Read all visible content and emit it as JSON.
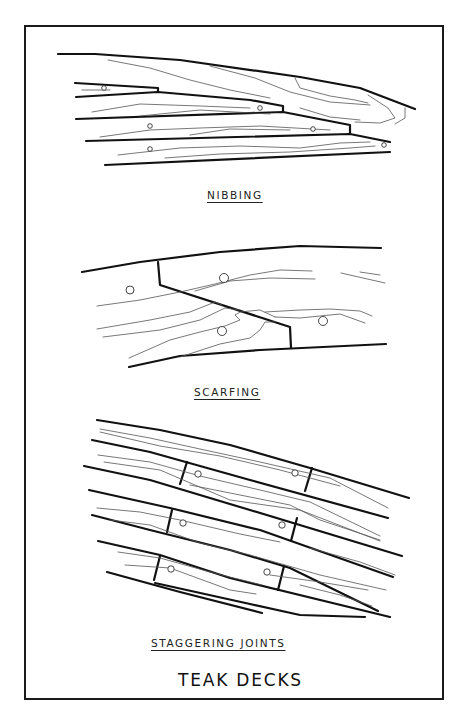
{
  "figure": {
    "title": "TEAK DECKS",
    "sections": [
      {
        "id": "nibbing",
        "caption": "NIBBING"
      },
      {
        "id": "scarfing",
        "caption": "SCARFING"
      },
      {
        "id": "staggering",
        "caption": "STAGGERING JOINTS"
      }
    ]
  },
  "colors": {
    "ink": "#111111",
    "grain": "#555555",
    "background": "#ffffff"
  }
}
